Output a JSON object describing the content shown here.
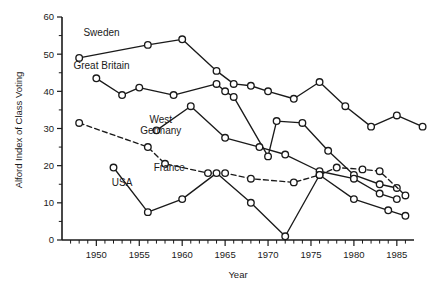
{
  "chart_data": {
    "type": "line",
    "title": "",
    "xlabel": "Year",
    "ylabel": "Alford Index of Class Voting",
    "xlim": [
      1946,
      1987
    ],
    "ylim": [
      0,
      60
    ],
    "ytick_values": [
      0,
      10,
      20,
      30,
      40,
      50,
      60
    ],
    "ytick_labels": [
      "0",
      "10",
      "20",
      "30",
      "40",
      "50",
      "60"
    ],
    "xtick_labels": [
      "1950",
      "1955",
      "1960",
      "1965",
      "1970",
      "1975",
      "1980",
      "1985"
    ],
    "xtick_values": [
      1950,
      1955,
      1960,
      1965,
      1970,
      1975,
      1980,
      1985
    ],
    "xtick_minor_step": 1,
    "grid": false,
    "legend_position": "inline-annotations",
    "series": [
      {
        "name": "Sweden",
        "style": "solid",
        "label_x": 1950.6,
        "label_y": 55.0,
        "points": [
          {
            "x": 1948,
            "y": 49.0
          },
          {
            "x": 1956,
            "y": 52.5
          },
          {
            "x": 1960,
            "y": 54.0
          },
          {
            "x": 1964,
            "y": 45.5
          },
          {
            "x": 1966,
            "y": 42.0
          },
          {
            "x": 1968,
            "y": 41.5
          },
          {
            "x": 1970,
            "y": 40.0
          },
          {
            "x": 1973,
            "y": 38.0
          },
          {
            "x": 1976,
            "y": 42.5
          },
          {
            "x": 1979,
            "y": 36.0
          },
          {
            "x": 1982,
            "y": 30.5
          },
          {
            "x": 1985,
            "y": 33.5
          },
          {
            "x": 1988,
            "y": 30.5
          }
        ]
      },
      {
        "name": "Great Britain",
        "style": "solid",
        "label_x": 1950.6,
        "label_y": 46.0,
        "points": [
          {
            "x": 1950,
            "y": 43.5
          },
          {
            "x": 1953,
            "y": 39.0
          },
          {
            "x": 1955,
            "y": 41.0
          },
          {
            "x": 1959,
            "y": 39.0
          },
          {
            "x": 1964,
            "y": 42.0
          },
          {
            "x": 1965,
            "y": 40.0
          },
          {
            "x": 1966,
            "y": 38.5
          },
          {
            "x": 1970,
            "y": 22.5
          },
          {
            "x": 1971,
            "y": 32.0
          },
          {
            "x": 1974,
            "y": 31.5
          },
          {
            "x": 1977,
            "y": 24.0
          },
          {
            "x": 1980,
            "y": 17.5
          },
          {
            "x": 1983,
            "y": 15.0
          },
          {
            "x": 1985,
            "y": 14.0
          }
        ]
      },
      {
        "name": "West Germany",
        "style": "solid",
        "label_x": 1957.5,
        "label_y": 31.5,
        "points": [
          {
            "x": 1957,
            "y": 29.5
          },
          {
            "x": 1961,
            "y": 36.0
          },
          {
            "x": 1965,
            "y": 27.5
          },
          {
            "x": 1969,
            "y": 25.0
          },
          {
            "x": 1972,
            "y": 23.0
          },
          {
            "x": 1976,
            "y": 18.5
          },
          {
            "x": 1980,
            "y": 16.5
          },
          {
            "x": 1983,
            "y": 12.5
          },
          {
            "x": 1985,
            "y": 11.0
          }
        ]
      },
      {
        "name": "France",
        "style": "dashed",
        "label_x": 1958.5,
        "label_y": 18.5,
        "points": [
          {
            "x": 1948,
            "y": 31.5
          },
          {
            "x": 1956,
            "y": 25.0
          },
          {
            "x": 1958,
            "y": 20.5
          },
          {
            "x": 1963,
            "y": 18.0
          },
          {
            "x": 1965,
            "y": 18.0
          },
          {
            "x": 1968,
            "y": 16.5
          },
          {
            "x": 1973,
            "y": 15.5
          },
          {
            "x": 1976,
            "y": 17.5
          },
          {
            "x": 1978,
            "y": 19.5
          },
          {
            "x": 1981,
            "y": 19.0
          },
          {
            "x": 1983,
            "y": 18.5
          },
          {
            "x": 1986,
            "y": 12.0
          }
        ]
      },
      {
        "name": "USA",
        "style": "solid",
        "label_x": 1953.0,
        "label_y": 14.5,
        "points": [
          {
            "x": 1952,
            "y": 19.5
          },
          {
            "x": 1956,
            "y": 7.5
          },
          {
            "x": 1960,
            "y": 11.0
          },
          {
            "x": 1964,
            "y": 18.0
          },
          {
            "x": 1968,
            "y": 10.0
          },
          {
            "x": 1972,
            "y": 1.0
          },
          {
            "x": 1976,
            "y": 17.5
          },
          {
            "x": 1980,
            "y": 11.0
          },
          {
            "x": 1984,
            "y": 8.0
          },
          {
            "x": 1986,
            "y": 6.5
          }
        ]
      }
    ]
  }
}
